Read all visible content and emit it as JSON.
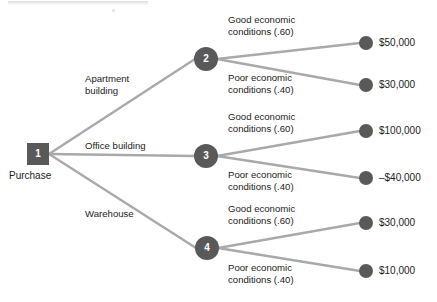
{
  "diagram": {
    "type": "decision-tree",
    "colors": {
      "node_fill": "#595959",
      "branch_line": "#a9a9a9",
      "text": "#1b1b1b",
      "background": "#ffffff"
    },
    "root": {
      "id": "1",
      "shape": "square",
      "caption": "Purchase",
      "x": 38,
      "y": 154
    },
    "decision_branches": [
      {
        "label_lines": [
          "Apartment",
          "building"
        ],
        "label_x": 85,
        "label_y": 73,
        "to_node": "2"
      },
      {
        "label_lines": [
          "Office building"
        ],
        "label_x": 85,
        "label_y": 140,
        "to_node": "3"
      },
      {
        "label_lines": [
          "Warehouse"
        ],
        "label_x": 85,
        "label_y": 208,
        "to_node": "4"
      }
    ],
    "chance_nodes": [
      {
        "id": "2",
        "shape": "circle",
        "x": 206,
        "y": 59
      },
      {
        "id": "3",
        "shape": "circle",
        "x": 206,
        "y": 156
      },
      {
        "id": "4",
        "shape": "circle",
        "x": 207,
        "y": 248
      }
    ],
    "outcome_branches": [
      {
        "node": "2",
        "label_lines": [
          "Good economic",
          "conditions (.60)"
        ],
        "label_x": 228,
        "label_y": 14,
        "payoff": "$50,000",
        "leaf_x": 366,
        "leaf_y": 43,
        "payoff_x": 379,
        "payoff_y": 37
      },
      {
        "node": "2",
        "label_lines": [
          "Poor economic",
          "conditions (.40)"
        ],
        "label_x": 228,
        "label_y": 72,
        "payoff": "$30,000",
        "leaf_x": 366,
        "leaf_y": 85,
        "payoff_x": 379,
        "payoff_y": 79
      },
      {
        "node": "3",
        "label_lines": [
          "Good economic",
          "conditions (.60)"
        ],
        "label_x": 228,
        "label_y": 111,
        "payoff": "$100,000",
        "leaf_x": 366,
        "leaf_y": 131,
        "payoff_x": 379,
        "payoff_y": 125
      },
      {
        "node": "3",
        "label_lines": [
          "Poor economic",
          "conditions (.40)"
        ],
        "label_x": 228,
        "label_y": 169,
        "payoff": "–$40,000",
        "leaf_x": 366,
        "leaf_y": 178,
        "payoff_x": 379,
        "payoff_y": 172
      },
      {
        "node": "4",
        "label_lines": [
          "Good economic",
          "conditions (.60)"
        ],
        "label_x": 228,
        "label_y": 203,
        "payoff": "$30,000",
        "leaf_x": 366,
        "leaf_y": 223,
        "payoff_x": 379,
        "payoff_y": 217
      },
      {
        "node": "4",
        "label_lines": [
          "Poor economic",
          "conditions (.40)"
        ],
        "label_x": 228,
        "label_y": 262,
        "payoff": "$10,000",
        "leaf_x": 366,
        "leaf_y": 271,
        "payoff_x": 379,
        "payoff_y": 265
      }
    ]
  }
}
